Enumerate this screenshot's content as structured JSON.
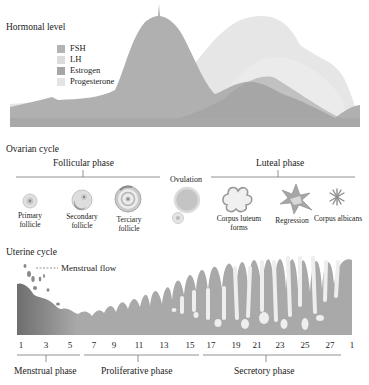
{
  "hormonal": {
    "title": "Hormonal level",
    "legend": [
      {
        "name": "FSH",
        "color": "#b4b4b4"
      },
      {
        "name": "LH",
        "color": "#dcdcdc"
      },
      {
        "name": "Estrogen",
        "color": "#a6a6a6"
      },
      {
        "name": "Progesterone",
        "color": "#e4e4e4"
      }
    ]
  },
  "ovarian": {
    "title": "Ovarian cycle",
    "follicular_phase": "Follicular phase",
    "ovulation": "Ovulation",
    "luteal_phase": "Luteal phase",
    "stages": [
      {
        "line1": "Primary",
        "line2": "follicle"
      },
      {
        "line1": "Secondary",
        "line2": "follicle"
      },
      {
        "line1": "Terciary",
        "line2": "follicle"
      },
      {
        "line1": "Corpus luteum",
        "line2": "forms"
      },
      {
        "line1": "Regression",
        "line2": ""
      },
      {
        "line1": "Corpus albicans",
        "line2": ""
      }
    ]
  },
  "uterine": {
    "title": "Uterine cycle",
    "menstrual_flow": "Menstrual flow",
    "days": [
      "1",
      "3",
      "5",
      "7",
      "9",
      "11",
      "13",
      "15",
      "17",
      "19",
      "21",
      "23",
      "25",
      "27",
      "1"
    ],
    "phases": [
      "Menstrual phase",
      "Proliferative phase",
      "Secretory phase"
    ]
  },
  "colors": {
    "fsh": "#b0b0b0",
    "lh": "#e6e6e6",
    "estrogen": "#9e9e9e",
    "progesterone": "#ececec",
    "endometrium": "#a9a9a9",
    "endometrium_dark": "#6e6e6e",
    "gland": "#efefef",
    "rule": "#777777"
  }
}
